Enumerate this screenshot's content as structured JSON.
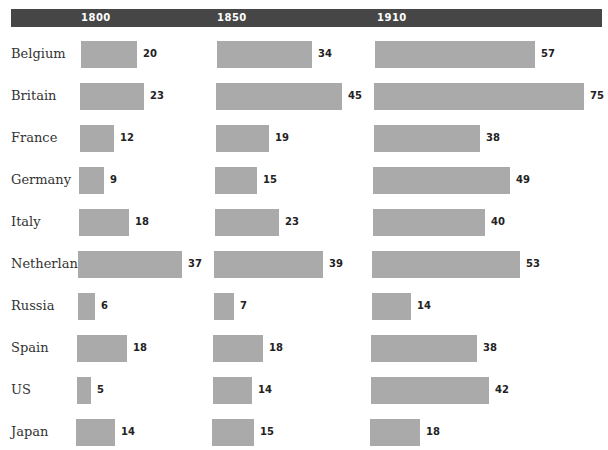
{
  "chart_data": {
    "type": "bar",
    "orientation": "horizontal",
    "title": "",
    "xlabel": "",
    "ylabel": "",
    "grid": false,
    "legend": "none",
    "categories": [
      "Belgium",
      "Britain",
      "France",
      "Germany",
      "Italy",
      "Netherlands",
      "Russia",
      "Spain",
      "US",
      "Japan"
    ],
    "series": [
      {
        "name": "1800",
        "values": [
          20,
          23,
          12,
          9,
          18,
          37,
          6,
          18,
          5,
          14
        ]
      },
      {
        "name": "1850",
        "values": [
          34,
          45,
          19,
          15,
          23,
          39,
          7,
          18,
          14,
          15
        ]
      },
      {
        "name": "1910",
        "values": [
          57,
          75,
          38,
          49,
          40,
          53,
          14,
          38,
          42,
          18
        ]
      }
    ]
  },
  "header": {
    "years": [
      "1800",
      "1850",
      "1910"
    ]
  },
  "colors": {
    "header_bg": "#464646",
    "bar": "#aaaaaa",
    "header_text": "#ffffff"
  }
}
